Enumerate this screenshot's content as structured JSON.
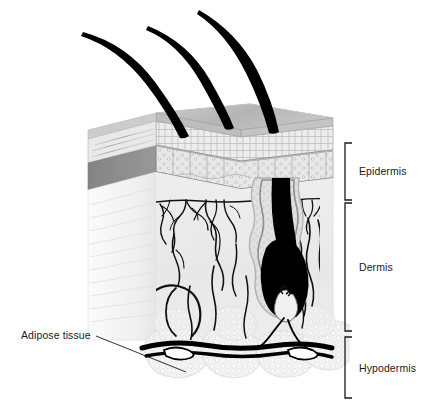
{
  "figure": {
    "type": "anatomical-diagram",
    "width": 432,
    "height": 419,
    "background": "#ffffff"
  },
  "labels": {
    "epidermis": "Epidermis",
    "dermis": "Dermis",
    "hypodermis": "Hypodermis",
    "adipose": "Adipose tissue"
  },
  "brackets": [
    {
      "name": "epidermis",
      "top": 143,
      "bottom": 200,
      "x": 345
    },
    {
      "name": "dermis",
      "top": 203,
      "bottom": 331,
      "x": 345
    },
    {
      "name": "hypodermis",
      "top": 337,
      "bottom": 398,
      "x": 345
    }
  ],
  "structures": [
    {
      "name": "hair-shaft",
      "count": 3
    },
    {
      "name": "hair-follicle",
      "count": 1
    },
    {
      "name": "hair-bulb",
      "count": 1
    },
    {
      "name": "dermal-papilla",
      "count": 1
    },
    {
      "name": "nerve-network",
      "count": 2
    },
    {
      "name": "blood-vessel-network",
      "count": 1
    },
    {
      "name": "adipose-lobule",
      "count": 4
    },
    {
      "name": "subcutaneous-vessel",
      "count": 2
    }
  ],
  "colors": {
    "outline": "#000000",
    "text": "#1a1a1a",
    "skin_surface": "#b9b9b9",
    "surface_highlight": "#cfcfcf",
    "stratum_corneum": "#ededed",
    "corneum_line": "#a8a8a8",
    "basal_layer": "#e4e4e4",
    "basal_dot": "#9a9a9a",
    "side_face_dark": "#8e8e8e",
    "side_face_light": "#f2f2f2",
    "dermis_fill": "#ebebeb",
    "dermis_side": "#f6f6f6",
    "follicle_wall": "#c9c9c9",
    "hair_black": "#000000",
    "adipose_fill": "#f0f0f0",
    "adipose_outline": "#dcdcdc",
    "bracket": "#1a1a1a"
  }
}
